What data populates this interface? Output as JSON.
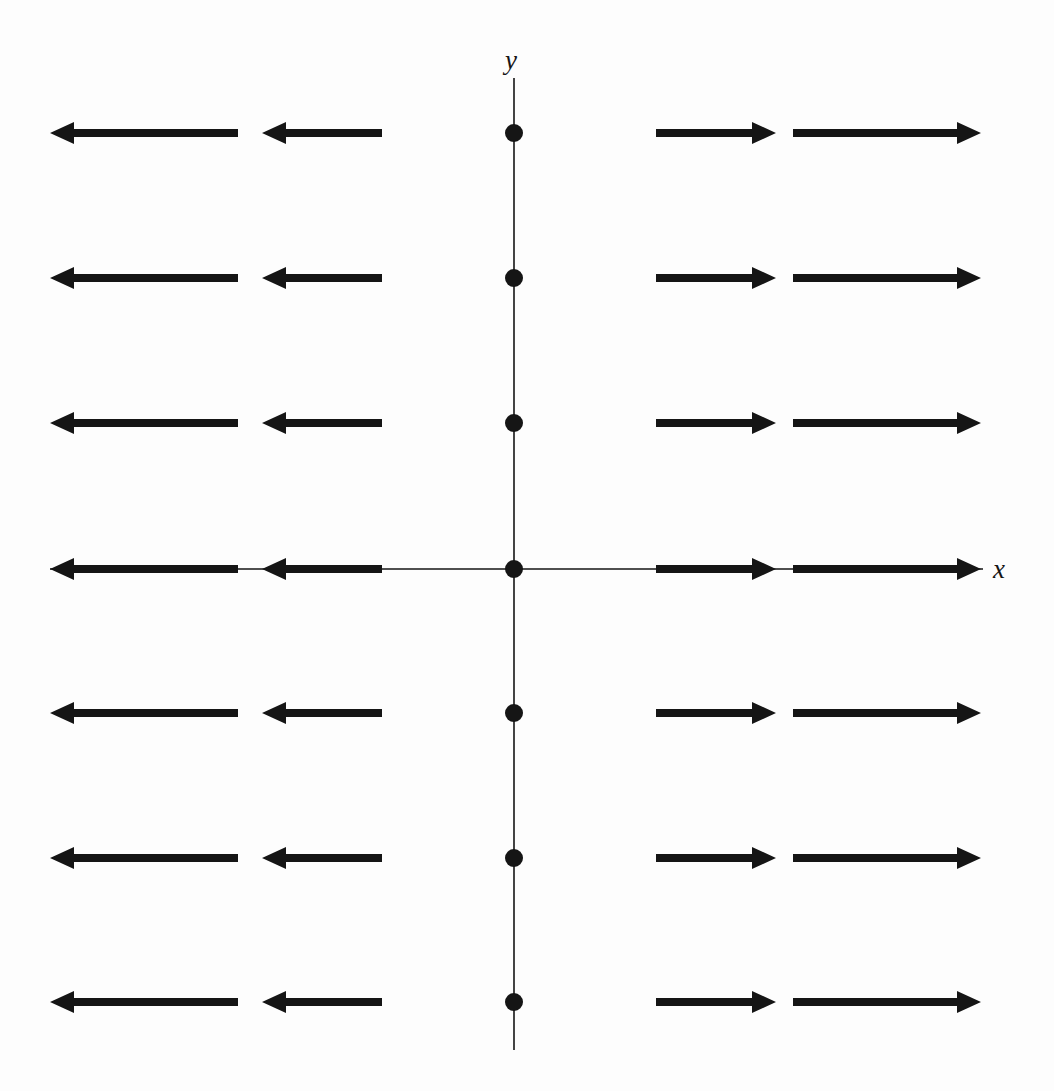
{
  "figure": {
    "title": "",
    "background_color": "#fdfdfd",
    "ink_color": "#151515",
    "width": 1054,
    "height": 1091
  },
  "axes": {
    "x_label": "x",
    "y_label": "y",
    "x_axis": {
      "name": "x-axis",
      "pixel_y": 569,
      "pixel_x_start": 50,
      "pixel_x_end": 983,
      "line_width": 1.6,
      "has_arrowheads": false
    },
    "y_axis": {
      "name": "y-axis",
      "pixel_x": 514,
      "pixel_y_start": 78,
      "pixel_y_end": 1050,
      "line_width": 1.6,
      "has_arrowheads": false
    },
    "origin": {
      "pixel_x": 514,
      "pixel_y": 569
    }
  },
  "chart_data": {
    "type": "scatter",
    "subtype": "vector-field",
    "title": "",
    "xlabel": "x",
    "ylabel": "y",
    "grid": false,
    "legend": null,
    "field_formula": "F(x, y) = <x, 0>",
    "xlim": [
      -3,
      3
    ],
    "ylim": [
      -3,
      3
    ],
    "x_sample_points": [
      -2,
      -1,
      1,
      2
    ],
    "y_sample_points": [
      3,
      2,
      1,
      0,
      -1,
      -2,
      -3
    ],
    "pixels_per_unit_x": 132,
    "pixels_per_unit_y": 145,
    "arrow_style": {
      "shaft_thickness_px": 8,
      "head_length_px": 24,
      "head_half_width_px": 11,
      "color": "#151515"
    },
    "dot_markers": {
      "count": 7,
      "radius_px": 9,
      "color": "#151515",
      "note": "filled dots on the y-axis at each sampled y value (x = 0, where the field vanishes)",
      "points": [
        {
          "x": 0,
          "y": 3,
          "px": 514,
          "py": 133
        },
        {
          "x": 0,
          "y": 2,
          "px": 514,
          "py": 278
        },
        {
          "x": 0,
          "y": 1,
          "px": 514,
          "py": 423
        },
        {
          "x": 0,
          "y": 0,
          "px": 514,
          "py": 569
        },
        {
          "x": 0,
          "y": -1,
          "px": 514,
          "py": 713
        },
        {
          "x": 0,
          "y": -2,
          "px": 514,
          "py": 858
        },
        {
          "x": 0,
          "y": -3,
          "px": 514,
          "py": 1002
        }
      ]
    },
    "rows": [
      {
        "y": 3,
        "pixel_y": 133,
        "arrows": [
          {
            "x": -2,
            "direction": "left",
            "u": -2,
            "v": 0,
            "tail_px": 238,
            "tip_px": 50
          },
          {
            "x": -1,
            "direction": "left",
            "u": -1,
            "v": 0,
            "tail_px": 382,
            "tip_px": 262
          },
          {
            "x": 1,
            "direction": "right",
            "u": 1,
            "v": 0,
            "tail_px": 656,
            "tip_px": 776
          },
          {
            "x": 2,
            "direction": "right",
            "u": 2,
            "v": 0,
            "tail_px": 793,
            "tip_px": 981
          }
        ]
      },
      {
        "y": 2,
        "pixel_y": 278,
        "arrows": [
          {
            "x": -2,
            "direction": "left",
            "u": -2,
            "v": 0,
            "tail_px": 238,
            "tip_px": 50
          },
          {
            "x": -1,
            "direction": "left",
            "u": -1,
            "v": 0,
            "tail_px": 382,
            "tip_px": 262
          },
          {
            "x": 1,
            "direction": "right",
            "u": 1,
            "v": 0,
            "tail_px": 656,
            "tip_px": 776
          },
          {
            "x": 2,
            "direction": "right",
            "u": 2,
            "v": 0,
            "tail_px": 793,
            "tip_px": 981
          }
        ]
      },
      {
        "y": 1,
        "pixel_y": 423,
        "arrows": [
          {
            "x": -2,
            "direction": "left",
            "u": -2,
            "v": 0,
            "tail_px": 238,
            "tip_px": 50
          },
          {
            "x": -1,
            "direction": "left",
            "u": -1,
            "v": 0,
            "tail_px": 382,
            "tip_px": 262
          },
          {
            "x": 1,
            "direction": "right",
            "u": 1,
            "v": 0,
            "tail_px": 656,
            "tip_px": 776
          },
          {
            "x": 2,
            "direction": "right",
            "u": 2,
            "v": 0,
            "tail_px": 793,
            "tip_px": 981
          }
        ]
      },
      {
        "y": 0,
        "pixel_y": 569,
        "arrows": [
          {
            "x": -2,
            "direction": "left",
            "u": -2,
            "v": 0,
            "tail_px": 238,
            "tip_px": 50
          },
          {
            "x": -1,
            "direction": "left",
            "u": -1,
            "v": 0,
            "tail_px": 382,
            "tip_px": 262
          },
          {
            "x": 1,
            "direction": "right",
            "u": 1,
            "v": 0,
            "tail_px": 656,
            "tip_px": 776
          },
          {
            "x": 2,
            "direction": "right",
            "u": 2,
            "v": 0,
            "tail_px": 793,
            "tip_px": 981
          }
        ]
      },
      {
        "y": -1,
        "pixel_y": 713,
        "arrows": [
          {
            "x": -2,
            "direction": "left",
            "u": -2,
            "v": 0,
            "tail_px": 238,
            "tip_px": 50
          },
          {
            "x": -1,
            "direction": "left",
            "u": -1,
            "v": 0,
            "tail_px": 382,
            "tip_px": 262
          },
          {
            "x": 1,
            "direction": "right",
            "u": 1,
            "v": 0,
            "tail_px": 656,
            "tip_px": 776
          },
          {
            "x": 2,
            "direction": "right",
            "u": 2,
            "v": 0,
            "tail_px": 793,
            "tip_px": 981
          }
        ]
      },
      {
        "y": -2,
        "pixel_y": 858,
        "arrows": [
          {
            "x": -2,
            "direction": "left",
            "u": -2,
            "v": 0,
            "tail_px": 238,
            "tip_px": 50
          },
          {
            "x": -1,
            "direction": "left",
            "u": -1,
            "v": 0,
            "tail_px": 382,
            "tip_px": 262
          },
          {
            "x": 1,
            "direction": "right",
            "u": 1,
            "v": 0,
            "tail_px": 656,
            "tip_px": 776
          },
          {
            "x": 2,
            "direction": "right",
            "u": 2,
            "v": 0,
            "tail_px": 793,
            "tip_px": 981
          }
        ]
      },
      {
        "y": -3,
        "pixel_y": 1002,
        "arrows": [
          {
            "x": -2,
            "direction": "left",
            "u": -2,
            "v": 0,
            "tail_px": 238,
            "tip_px": 50
          },
          {
            "x": -1,
            "direction": "left",
            "u": -1,
            "v": 0,
            "tail_px": 382,
            "tip_px": 262
          },
          {
            "x": 1,
            "direction": "right",
            "u": 1,
            "v": 0,
            "tail_px": 656,
            "tip_px": 776
          },
          {
            "x": 2,
            "direction": "right",
            "u": 2,
            "v": 0,
            "tail_px": 793,
            "tip_px": 981
          }
        ]
      }
    ]
  }
}
